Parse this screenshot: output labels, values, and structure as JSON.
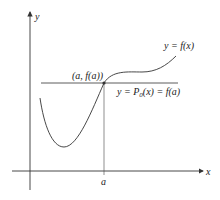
{
  "figure": {
    "axes": {
      "x_label": "x",
      "y_label": "y"
    },
    "tick_label_a": "a",
    "point_label": "(a, f(a))",
    "curve_label": "y = f(x)",
    "line_label_prefix": "y = P",
    "line_label_subscript": "0",
    "line_label_suffix": "(x) = f(a)",
    "colors": {
      "stroke": "#333333",
      "text": "#222222",
      "background": "#ffffff"
    }
  }
}
